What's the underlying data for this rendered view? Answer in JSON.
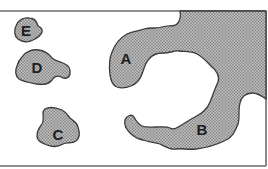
{
  "diagram": {
    "type": "labeled-regions-map",
    "colors": {
      "fill": "#a8a8a8",
      "fill_dot_dark": "#7c7c7c",
      "fill_dot_light": "#c9c9c9",
      "outline": "#3a3a3a",
      "frame": "#6a6a6a",
      "background": "#ffffff",
      "label": "#1e1e1e"
    },
    "regions": [
      {
        "id": "A",
        "label": "A",
        "description": "large landmass curving around inlet, top right"
      },
      {
        "id": "B",
        "label": "B",
        "description": "peninsula extending along bottom of inlet"
      },
      {
        "id": "C",
        "label": "C",
        "description": "island, lower left"
      },
      {
        "id": "D",
        "label": "D",
        "description": "island, middle left"
      },
      {
        "id": "E",
        "label": "E",
        "description": "small island, upper left"
      }
    ]
  }
}
